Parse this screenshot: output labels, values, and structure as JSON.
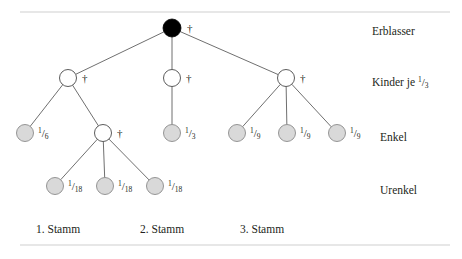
{
  "figure": {
    "type": "genealogy-tree",
    "rules": [
      {
        "name": "top-rule",
        "x1": 20,
        "y1": 12,
        "x2": 450,
        "y2": 12
      },
      {
        "name": "bottom-rule",
        "x1": 20,
        "y1": 245,
        "x2": 450,
        "y2": 245
      }
    ],
    "symbols": {
      "dagger": "†",
      "slash": "/"
    },
    "colors": {
      "deceased_node": "#000000",
      "intermediate_node": "#ffffff",
      "heir_node": "#d9d9d9",
      "edge": "#4a4a4a",
      "rule": "#cfcfcf",
      "text": "#231f20"
    },
    "row_labels": [
      {
        "id": "erblasser",
        "text": "Erblasser",
        "x": 372,
        "y": 31
      },
      {
        "id": "kinder",
        "text": "Kinder je",
        "fraction": {
          "num": "1",
          "den": "3"
        },
        "x": 372,
        "y": 82
      },
      {
        "id": "enkel",
        "text": "Enkel",
        "x": 380,
        "y": 137
      },
      {
        "id": "urenkel",
        "text": "Urenkel",
        "x": 380,
        "y": 190
      }
    ],
    "stamm_labels": [
      {
        "id": "stamm-1",
        "text": "1. Stamm",
        "x": 36,
        "y": 229
      },
      {
        "id": "stamm-2",
        "text": "2. Stamm",
        "x": 140,
        "y": 229
      },
      {
        "id": "stamm-3",
        "text": "3. Stamm",
        "x": 240,
        "y": 229
      }
    ],
    "nodes": [
      {
        "id": "erblasser",
        "kind": "deceased",
        "x": 172,
        "y": 28,
        "r": 9,
        "dagger": "†",
        "dagger_x": 187,
        "dagger_y": 28,
        "share": null
      },
      {
        "id": "kind-1",
        "kind": "intermediate",
        "x": 68,
        "y": 78,
        "r": 8.5,
        "dagger": "†",
        "dagger_x": 82,
        "dagger_y": 78,
        "share": null
      },
      {
        "id": "kind-2",
        "kind": "intermediate",
        "x": 172,
        "y": 78,
        "r": 8.5,
        "dagger": "†",
        "dagger_x": 186,
        "dagger_y": 78,
        "share": null
      },
      {
        "id": "kind-3",
        "kind": "intermediate",
        "x": 286,
        "y": 78,
        "r": 8.5,
        "dagger": "†",
        "dagger_x": 300,
        "dagger_y": 78,
        "share": null
      },
      {
        "id": "enkel-1",
        "kind": "heir",
        "x": 25,
        "y": 133,
        "r": 8.5,
        "dagger": null,
        "share": {
          "num": "1",
          "den": "6"
        },
        "label_x": 38,
        "label_y": 133
      },
      {
        "id": "enkel-2",
        "kind": "intermediate",
        "x": 103,
        "y": 133,
        "r": 8.5,
        "dagger": "†",
        "dagger_x": 117,
        "dagger_y": 133,
        "share": null
      },
      {
        "id": "enkel-3",
        "kind": "heir",
        "x": 172,
        "y": 133,
        "r": 8.5,
        "dagger": null,
        "share": {
          "num": "1",
          "den": "3"
        },
        "label_x": 185,
        "label_y": 133
      },
      {
        "id": "enkel-4",
        "kind": "heir",
        "x": 237,
        "y": 133,
        "r": 8.5,
        "dagger": null,
        "share": {
          "num": "1",
          "den": "9"
        },
        "label_x": 250,
        "label_y": 133
      },
      {
        "id": "enkel-5",
        "kind": "heir",
        "x": 287,
        "y": 133,
        "r": 8.5,
        "dagger": null,
        "share": {
          "num": "1",
          "den": "9"
        },
        "label_x": 300,
        "label_y": 133
      },
      {
        "id": "enkel-6",
        "kind": "heir",
        "x": 337,
        "y": 133,
        "r": 8.5,
        "dagger": null,
        "share": {
          "num": "1",
          "den": "9"
        },
        "label_x": 350,
        "label_y": 133
      },
      {
        "id": "urenkel-1",
        "kind": "heir",
        "x": 55,
        "y": 186,
        "r": 8.5,
        "dagger": null,
        "share": {
          "num": "1",
          "den": "18"
        },
        "label_x": 68,
        "label_y": 186
      },
      {
        "id": "urenkel-2",
        "kind": "heir",
        "x": 105,
        "y": 186,
        "r": 8.5,
        "dagger": null,
        "share": {
          "num": "1",
          "den": "18"
        },
        "label_x": 118,
        "label_y": 186
      },
      {
        "id": "urenkel-3",
        "kind": "heir",
        "x": 155,
        "y": 186,
        "r": 8.5,
        "dagger": null,
        "share": {
          "num": "1",
          "den": "18"
        },
        "label_x": 168,
        "label_y": 186
      }
    ],
    "edges": [
      {
        "id": "erblasser-kind-1",
        "from": "erblasser",
        "to": "kind-1"
      },
      {
        "id": "erblasser-kind-2",
        "from": "erblasser",
        "to": "kind-2"
      },
      {
        "id": "erblasser-kind-3",
        "from": "erblasser",
        "to": "kind-3"
      },
      {
        "id": "kind-1-enkel-1",
        "from": "kind-1",
        "to": "enkel-1"
      },
      {
        "id": "kind-1-enkel-2",
        "from": "kind-1",
        "to": "enkel-2"
      },
      {
        "id": "kind-2-enkel-3",
        "from": "kind-2",
        "to": "enkel-3"
      },
      {
        "id": "kind-3-enkel-4",
        "from": "kind-3",
        "to": "enkel-4"
      },
      {
        "id": "kind-3-enkel-5",
        "from": "kind-3",
        "to": "enkel-5"
      },
      {
        "id": "kind-3-enkel-6",
        "from": "kind-3",
        "to": "enkel-6"
      },
      {
        "id": "enkel-2-urenkel-1",
        "from": "enkel-2",
        "to": "urenkel-1"
      },
      {
        "id": "enkel-2-urenkel-2",
        "from": "enkel-2",
        "to": "urenkel-2"
      },
      {
        "id": "enkel-2-urenkel-3",
        "from": "enkel-2",
        "to": "urenkel-3"
      }
    ]
  }
}
